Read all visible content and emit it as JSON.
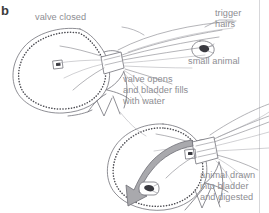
{
  "figure": {
    "title_glyph": "b",
    "background_color": "#ffffff",
    "ink_color": "#6f6f76",
    "label_color": "#8d8d92",
    "arrow_fill": "#a9a9ad",
    "arrow_stroke": "#6f6f76"
  },
  "labels": {
    "valve_closed": "valve closed",
    "trigger_hairs_line1": "trigger",
    "trigger_hairs_line2": "hairs",
    "small_animal": "small animal",
    "valve_opens_line1": "valve opens",
    "valve_opens_line2": "and bladder fills",
    "valve_opens_line3": "with water",
    "digested_line1": "animal drawn",
    "digested_line2": "into bladder",
    "digested_line3": "and digested"
  },
  "diagram_parts": {
    "upper_bladder": "bladder-closed-state",
    "lower_bladder": "bladder-open-state",
    "suction_arrow": "water-inflow-arrow",
    "animal_upper": "small-animal-outside",
    "animal_lower": "small-animal-captured",
    "valve_upper": "valve-closed-structure",
    "valve_lower": "valve-open-structure"
  }
}
